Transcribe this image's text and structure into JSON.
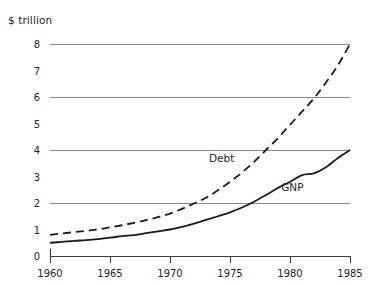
{
  "chart_data": {
    "type": "line",
    "title": "",
    "subtitle": "",
    "xlabel": "",
    "ylabel": "$ trillion",
    "xlim": [
      1960,
      1985
    ],
    "ylim": [
      0,
      8
    ],
    "grid": "horizontal-major-only",
    "gridlines_at": [
      2,
      4,
      6,
      8
    ],
    "legend_position": "inline-annotations",
    "x_ticks": [
      1960,
      1965,
      1970,
      1975,
      1980,
      1985
    ],
    "x_tick_labels": [
      "1960",
      "1965",
      "1970",
      "1975",
      "1980",
      "1985"
    ],
    "y_ticks": [
      0,
      1,
      2,
      3,
      4,
      5,
      6,
      7,
      8
    ],
    "y_tick_labels": [
      "0",
      "1",
      "2",
      "3",
      "4",
      "5",
      "6",
      "7",
      "8"
    ],
    "series": [
      {
        "name": "Debt",
        "style": "dashed",
        "color": "#1a1a1a",
        "label_x": 1974.3,
        "label_y": 3.55,
        "x": [
          1960,
          1961,
          1962,
          1963,
          1964,
          1965,
          1966,
          1967,
          1968,
          1969,
          1970,
          1971,
          1972,
          1973,
          1974,
          1975,
          1976,
          1977,
          1978,
          1979,
          1980,
          1981,
          1982,
          1983,
          1984,
          1985
        ],
        "values": [
          0.8,
          0.85,
          0.9,
          0.95,
          1.0,
          1.08,
          1.16,
          1.25,
          1.35,
          1.47,
          1.6,
          1.78,
          1.98,
          2.2,
          2.48,
          2.8,
          3.15,
          3.55,
          4.0,
          4.45,
          4.95,
          5.45,
          5.95,
          6.55,
          7.2,
          8.0
        ]
      },
      {
        "name": "GNP",
        "style": "solid",
        "color": "#1a1a1a",
        "label_x": 1980.2,
        "label_y": 2.45,
        "x": [
          1960,
          1961,
          1962,
          1963,
          1964,
          1965,
          1966,
          1967,
          1968,
          1969,
          1970,
          1971,
          1972,
          1973,
          1974,
          1975,
          1976,
          1977,
          1978,
          1979,
          1980,
          1981,
          1982,
          1983,
          1984,
          1985
        ],
        "values": [
          0.5,
          0.53,
          0.57,
          0.6,
          0.64,
          0.69,
          0.75,
          0.79,
          0.86,
          0.93,
          1.0,
          1.1,
          1.22,
          1.36,
          1.5,
          1.65,
          1.83,
          2.05,
          2.3,
          2.57,
          2.8,
          3.05,
          3.12,
          3.35,
          3.7,
          4.0
        ]
      }
    ],
    "annotations": [
      {
        "text": "Debt",
        "x": 1974.3,
        "y": 3.55
      },
      {
        "text": "GNP",
        "x": 1980.2,
        "y": 2.45
      }
    ]
  },
  "axis": {
    "y_title": "$ trillion"
  },
  "colors": {
    "ink": "#1a1a1a",
    "gridline": "#8a8a8a",
    "axis": "#3d3d3d",
    "background": "#ffffff"
  }
}
